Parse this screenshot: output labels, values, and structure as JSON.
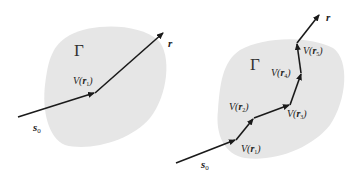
{
  "left_diagram": {
    "region_label": "Γ",
    "incoming_label": "s",
    "incoming_subscript": "0",
    "outgoing_label": "r",
    "nodes": [
      {
        "label": "V(",
        "var": "r",
        "sub": "1",
        "close": ")"
      }
    ]
  },
  "right_diagram": {
    "region_label": "Γ",
    "incoming_label": "s",
    "incoming_subscript": "0",
    "outgoing_label": "r",
    "nodes": [
      {
        "label": "V(",
        "var": "r",
        "sub": "1",
        "close": ")"
      },
      {
        "label": "V(",
        "var": "r",
        "sub": "2",
        "close": ")"
      },
      {
        "label": "V(",
        "var": "r",
        "sub": "3",
        "close": ")"
      },
      {
        "label": "V(",
        "var": "r",
        "sub": "4",
        "close": ")"
      },
      {
        "label": "V(",
        "var": "r",
        "sub": "5",
        "close": ")"
      }
    ]
  },
  "colors": {
    "region_fill": "#e6e6e6",
    "arrow": "#1a1a1a",
    "text": "#222222"
  }
}
